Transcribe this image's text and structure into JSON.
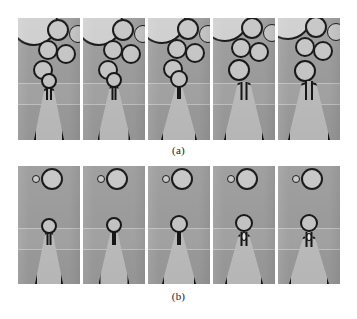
{
  "figure": {
    "kind": "micrograph-sequence",
    "background_color": "#ffffff",
    "frame_background": "#9b9b9b",
    "outline_color": "#121212",
    "fluid_color": "#c4c4c4",
    "rows": [
      {
        "id": "a",
        "caption": "(a)",
        "frame_count": 5,
        "frames": [
          {
            "index": 1,
            "label": "a1",
            "corner_bubble": {
              "cx": 16,
              "cy": 4,
              "r": 24
            },
            "bubbles": [
              {
                "cx": 40,
                "cy": 12,
                "r": 11
              },
              {
                "cx": 60,
                "cy": 16,
                "r": 9
              },
              {
                "cx": 30,
                "cy": 32,
                "r": 10
              },
              {
                "cx": 48,
                "cy": 36,
                "r": 10
              },
              {
                "cx": 25,
                "cy": 52,
                "r": 10
              }
            ],
            "head": {
              "cx": 31,
              "cy": 63,
              "r": 8
            },
            "neck": {
              "top": 70,
              "height": 12,
              "width": 6
            },
            "jet": {
              "height": 52,
              "top_width": 9,
              "bottom_width": 30
            },
            "satellite": null
          },
          {
            "index": 2,
            "label": "a2",
            "corner_bubble": {
              "cx": 16,
              "cy": 4,
              "r": 24
            },
            "bubbles": [
              {
                "cx": 40,
                "cy": 12,
                "r": 11
              },
              {
                "cx": 60,
                "cy": 16,
                "r": 9
              },
              {
                "cx": 30,
                "cy": 32,
                "r": 10
              },
              {
                "cx": 48,
                "cy": 36,
                "r": 10
              },
              {
                "cx": 25,
                "cy": 52,
                "r": 10
              }
            ],
            "head": {
              "cx": 31,
              "cy": 62,
              "r": 8
            },
            "neck": {
              "top": 69,
              "height": 13,
              "width": 5
            },
            "jet": {
              "height": 54,
              "top_width": 8,
              "bottom_width": 33
            },
            "satellite": null
          },
          {
            "index": 3,
            "label": "a3",
            "corner_bubble": {
              "cx": 14,
              "cy": 2,
              "r": 24
            },
            "bubbles": [
              {
                "cx": 40,
                "cy": 11,
                "r": 11
              },
              {
                "cx": 60,
                "cy": 16,
                "r": 9
              },
              {
                "cx": 29,
                "cy": 31,
                "r": 10
              },
              {
                "cx": 47,
                "cy": 35,
                "r": 10
              },
              {
                "cx": 25,
                "cy": 51,
                "r": 10
              }
            ],
            "head": {
              "cx": 31,
              "cy": 61,
              "r": 9
            },
            "neck": {
              "top": 69,
              "height": 12,
              "width": 3
            },
            "jet": {
              "height": 56,
              "top_width": 5,
              "bottom_width": 36
            },
            "satellite": null
          },
          {
            "index": 4,
            "label": "a4",
            "corner_bubble": {
              "cx": 12,
              "cy": 0,
              "r": 24
            },
            "bubbles": [
              {
                "cx": 39,
                "cy": 10,
                "r": 11
              },
              {
                "cx": 59,
                "cy": 15,
                "r": 9
              },
              {
                "cx": 28,
                "cy": 30,
                "r": 10
              },
              {
                "cx": 46,
                "cy": 34,
                "r": 10
              },
              {
                "cx": 26,
                "cy": 52,
                "r": 11
              }
            ],
            "head": null,
            "neck": {
              "top": 64,
              "height": 18,
              "width": 7
            },
            "jet": {
              "height": 58,
              "top_width": 12,
              "bottom_width": 40
            },
            "satellite": null
          },
          {
            "index": 5,
            "label": "a5",
            "corner_bubble": {
              "cx": 10,
              "cy": -2,
              "r": 24
            },
            "bubbles": [
              {
                "cx": 38,
                "cy": 9,
                "r": 11
              },
              {
                "cx": 58,
                "cy": 14,
                "r": 9
              },
              {
                "cx": 27,
                "cy": 29,
                "r": 10
              },
              {
                "cx": 45,
                "cy": 33,
                "r": 10
              },
              {
                "cx": 27,
                "cy": 53,
                "r": 11
              }
            ],
            "head": null,
            "neck": {
              "top": 63,
              "height": 19,
              "width": 8
            },
            "jet": {
              "height": 58,
              "top_width": 14,
              "bottom_width": 42
            },
            "satellite": null
          }
        ]
      },
      {
        "id": "b",
        "caption": "(b)",
        "frame_count": 5,
        "frames": [
          {
            "index": 1,
            "label": "b1",
            "corner_bubble": null,
            "bubbles": [
              {
                "cx": 18,
                "cy": 13,
                "r": 4
              },
              {
                "cx": 34,
                "cy": 13,
                "r": 11
              }
            ],
            "head": {
              "cx": 31,
              "cy": 60,
              "r": 8
            },
            "neck": {
              "top": 67,
              "height": 12,
              "width": 5
            },
            "jet": {
              "height": 52,
              "top_width": 7,
              "bottom_width": 28
            },
            "satellite": null
          },
          {
            "index": 2,
            "label": "b2",
            "corner_bubble": null,
            "bubbles": [
              {
                "cx": 18,
                "cy": 13,
                "r": 4
              },
              {
                "cx": 34,
                "cy": 13,
                "r": 11
              }
            ],
            "head": {
              "cx": 31,
              "cy": 59,
              "r": 8
            },
            "neck": {
              "top": 66,
              "height": 13,
              "width": 4
            },
            "jet": {
              "height": 54,
              "top_width": 6,
              "bottom_width": 31
            },
            "satellite": null
          },
          {
            "index": 3,
            "label": "b3",
            "corner_bubble": null,
            "bubbles": [
              {
                "cx": 18,
                "cy": 13,
                "r": 4
              },
              {
                "cx": 34,
                "cy": 13,
                "r": 11
              }
            ],
            "head": {
              "cx": 31,
              "cy": 58,
              "r": 9
            },
            "neck": {
              "top": 66,
              "height": 13,
              "width": 3
            },
            "jet": {
              "height": 56,
              "top_width": 4,
              "bottom_width": 34
            },
            "satellite": null
          },
          {
            "index": 4,
            "label": "b4",
            "corner_bubble": null,
            "bubbles": [
              {
                "cx": 18,
                "cy": 13,
                "r": 4
              },
              {
                "cx": 34,
                "cy": 13,
                "r": 11
              }
            ],
            "head": {
              "cx": 31,
              "cy": 57,
              "r": 9
            },
            "neck": {
              "top": 66,
              "height": 14,
              "width": 7
            },
            "jet": {
              "height": 50,
              "top_width": 10,
              "bottom_width": 38
            },
            "satellite": {
              "cy": 70,
              "w": 5,
              "h": 9
            }
          },
          {
            "index": 5,
            "label": "b5",
            "corner_bubble": null,
            "bubbles": [
              {
                "cx": 18,
                "cy": 13,
                "r": 4
              },
              {
                "cx": 34,
                "cy": 13,
                "r": 11
              }
            ],
            "head": {
              "cx": 31,
              "cy": 57,
              "r": 9
            },
            "neck": {
              "top": 66,
              "height": 15,
              "width": 7
            },
            "jet": {
              "height": 48,
              "top_width": 11,
              "bottom_width": 40
            },
            "satellite": {
              "cy": 71,
              "w": 5,
              "h": 8
            }
          }
        ]
      }
    ]
  }
}
